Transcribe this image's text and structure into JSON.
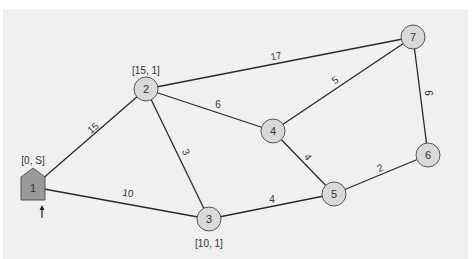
{
  "diagram": {
    "type": "weighted-undirected-graph",
    "colors": {
      "background": "#f0f0f0",
      "node_fill": "#d9d9d9",
      "start_node_fill": "#9a9a9a",
      "edge": "#2a2a2a",
      "text": "#333333"
    },
    "nodes": [
      {
        "id": "1",
        "label": "1",
        "shape": "pentagon",
        "x": 33,
        "y": 187,
        "annotation": "[0, S]",
        "ann_x": 33,
        "ann_y": 160,
        "start": true
      },
      {
        "id": "2",
        "label": "2",
        "shape": "circle",
        "x": 146,
        "y": 89,
        "annotation": "[15, 1]",
        "ann_x": 146,
        "ann_y": 70
      },
      {
        "id": "3",
        "label": "3",
        "shape": "circle",
        "x": 209,
        "y": 219,
        "annotation": "[10, 1]",
        "ann_x": 209,
        "ann_y": 243
      },
      {
        "id": "4",
        "label": "4",
        "shape": "circle",
        "x": 273,
        "y": 131,
        "annotation": ""
      },
      {
        "id": "5",
        "label": "5",
        "shape": "circle",
        "x": 334,
        "y": 194,
        "annotation": ""
      },
      {
        "id": "6",
        "label": "6",
        "shape": "circle",
        "x": 428,
        "y": 155,
        "annotation": ""
      },
      {
        "id": "7",
        "label": "7",
        "shape": "circle",
        "x": 413,
        "y": 37,
        "annotation": ""
      }
    ],
    "edges": [
      {
        "from": "1",
        "to": "2",
        "weight": "15",
        "lx": 93,
        "ly": 128,
        "rot": -40
      },
      {
        "from": "1",
        "to": "3",
        "weight": "10",
        "lx": 128,
        "ly": 193,
        "rot": 8
      },
      {
        "from": "2",
        "to": "3",
        "weight": "3",
        "lx": 186,
        "ly": 152,
        "rot": 65
      },
      {
        "from": "2",
        "to": "4",
        "weight": "6",
        "lx": 218,
        "ly": 104,
        "rot": 0
      },
      {
        "from": "2",
        "to": "7",
        "weight": "17",
        "lx": 276,
        "ly": 56,
        "rot": -10
      },
      {
        "from": "4",
        "to": "7",
        "weight": "5",
        "lx": 335,
        "ly": 80,
        "rot": -35
      },
      {
        "from": "4",
        "to": "5",
        "weight": "4",
        "lx": 308,
        "ly": 157,
        "rot": 55
      },
      {
        "from": "3",
        "to": "5",
        "weight": "4",
        "lx": 272,
        "ly": 199,
        "rot": 0
      },
      {
        "from": "5",
        "to": "6",
        "weight": "2",
        "lx": 380,
        "ly": 168,
        "rot": -25
      },
      {
        "from": "6",
        "to": "7",
        "weight": "6",
        "lx": 428,
        "ly": 93,
        "rot": 90
      }
    ],
    "start_arrow": {
      "x": 42,
      "y_top": 205,
      "y_bottom": 218
    }
  }
}
